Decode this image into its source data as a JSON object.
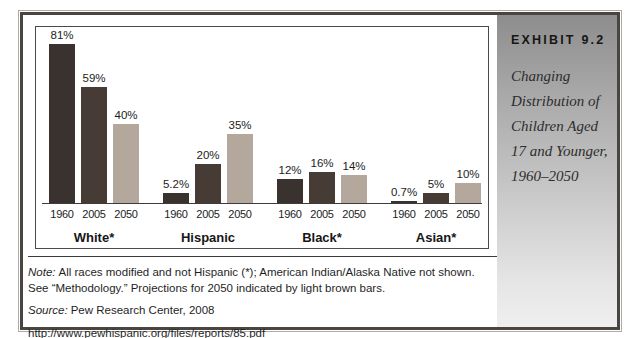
{
  "sidebar": {
    "exhibit_label": "EXHIBIT 9.2",
    "title": "Changing Distribution of Children Aged 17 and Younger, 1960–2050"
  },
  "notes": {
    "note_prefix": "Note:",
    "note_line1": "All races modified and not Hispanic (*); American Indian/Alaska Native not shown.",
    "note_line2": "See “Methodology.” Projections for 2050 indicated by light brown bars.",
    "source_prefix": "Source:",
    "source_text": "Pew Research Center, 2008",
    "url": "http://www.pewhispanic.org/files/reports/85.pdf"
  },
  "chart_data": {
    "type": "bar",
    "title": "Changing Distribution of Children Aged 17 and Younger, 1960–2050",
    "categories": [
      "White*",
      "Hispanic",
      "Black*",
      "Asian*"
    ],
    "series": [
      {
        "name": "1960",
        "values": [
          81,
          5.2,
          12,
          0.7
        ],
        "labels": [
          "81%",
          "5.2%",
          "12%",
          "0.7%"
        ],
        "color": "#3a322f"
      },
      {
        "name": "2005",
        "values": [
          59,
          20,
          16,
          5
        ],
        "labels": [
          "59%",
          "20%",
          "16%",
          "5%"
        ],
        "color": "#473b36"
      },
      {
        "name": "2050",
        "values": [
          40,
          35,
          14,
          10
        ],
        "labels": [
          "40%",
          "35%",
          "14%",
          "10%"
        ],
        "color": "#b4a89c"
      }
    ],
    "unit": "%",
    "xlabel": "",
    "ylabel": "",
    "ylim": [
      0,
      90
    ],
    "grid": false,
    "legend": "none",
    "note": "2050 bars shown in light brown (projections); 1960 and 2005 bars dark brown"
  },
  "colors": {
    "bar_1960": "#3a322f",
    "bar_2005": "#473b36",
    "bar_2050": "#b4a89c",
    "panel_gradient_top": "#8d8d8d",
    "panel_gradient_bottom": "#efefef",
    "frame_border": "#4b4540"
  }
}
